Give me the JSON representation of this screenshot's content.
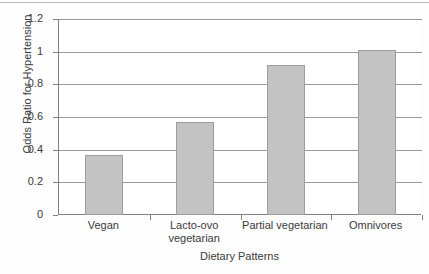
{
  "chart_data": {
    "type": "bar",
    "title": "",
    "categories": [
      "Vegan",
      "Lacto-ovo vegetarian",
      "Partial vegetarian",
      "Omnivores"
    ],
    "category_lines": [
      [
        "Vegan"
      ],
      [
        "Lacto-ovo",
        "vegetarian"
      ],
      [
        "Partial vegetarian"
      ],
      [
        "Omnivores"
      ]
    ],
    "values": [
      0.37,
      0.57,
      0.92,
      1.01
    ],
    "xlabel": "Dietary Patterns",
    "ylabel": "Odds Ratio for Hypertension",
    "ylim": [
      0,
      1.2
    ],
    "yticks": [
      "0",
      "0.2",
      "0.4",
      "0.6",
      "0.8",
      "1",
      "1.2"
    ],
    "ytick_values": [
      0,
      0.2,
      0.4,
      0.6,
      0.8,
      1,
      1.2
    ],
    "grid": true,
    "legend": "none",
    "bar_color": "#c3c3c3",
    "bar_border_color": "#9d9d9d",
    "grid_color": "#9a9a9a",
    "axis_color": "#808080"
  }
}
